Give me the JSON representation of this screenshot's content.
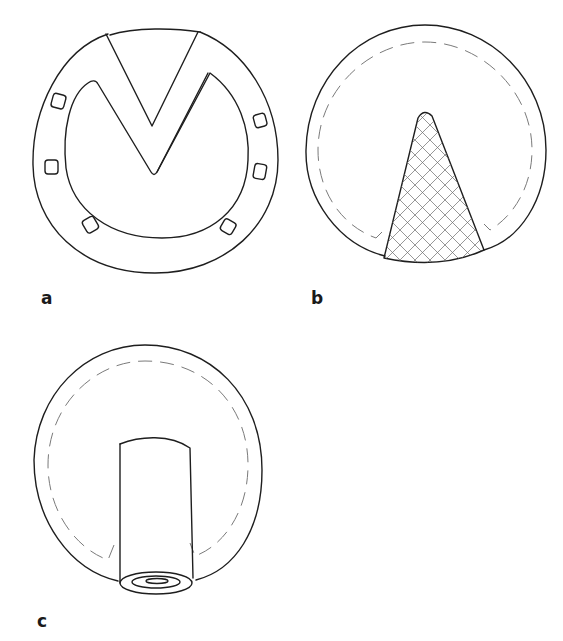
{
  "figure": {
    "panels": [
      {
        "id": "a",
        "label": "a",
        "description": "Circular plate with V-shaped notch and six small square perforations around the rim"
      },
      {
        "id": "b",
        "label": "b",
        "description": "Circular flap with dashed inner outline and cross-hatched triangular wedge at the bottom"
      },
      {
        "id": "c",
        "label": "c",
        "description": "Circular flap with dashed inner outline and a cylindrical tube inserted at the bottom"
      }
    ]
  },
  "colors": {
    "ink": "#1e1e1e",
    "dashed_line": "#7a7a7a",
    "background": "#ffffff"
  }
}
